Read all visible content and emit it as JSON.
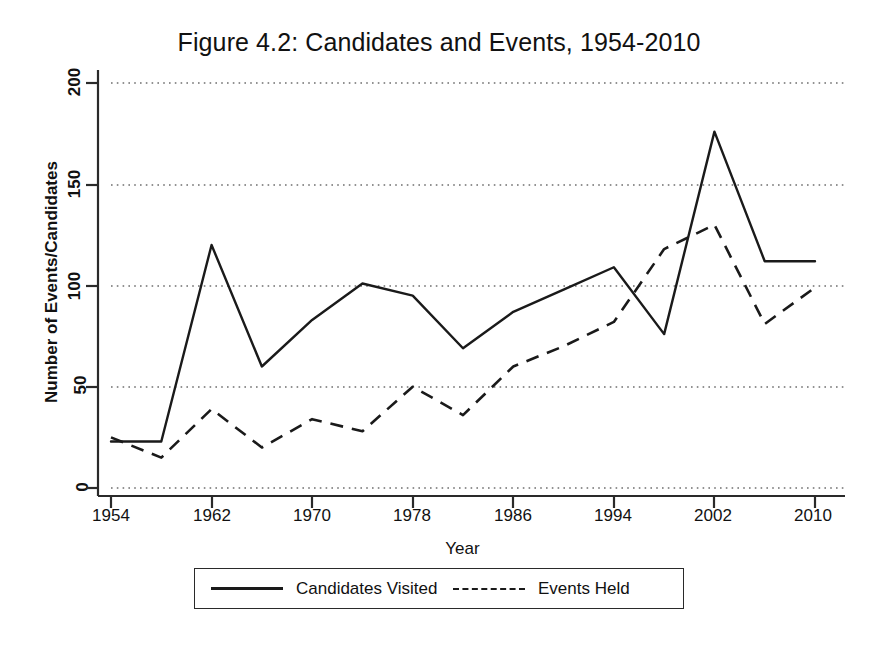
{
  "chart_data": {
    "type": "line",
    "title": "Figure 4.2: Candidates and Events, 1954-2010",
    "xlabel": "Year",
    "ylabel": "Number of Events/Candidates",
    "x": [
      1954,
      1958,
      1962,
      1966,
      1970,
      1974,
      1978,
      1982,
      1986,
      1990,
      1994,
      1998,
      2002,
      2006,
      2010
    ],
    "series": [
      {
        "name": "Candidates Visited",
        "style": "solid",
        "color": "#1a1a1a",
        "values": [
          23,
          23,
          120,
          60,
          83,
          101,
          95,
          69,
          87,
          98,
          109,
          76,
          176,
          112,
          112
        ]
      },
      {
        "name": "Events Held",
        "style": "dashed",
        "color": "#1a1a1a",
        "values": [
          25,
          15,
          39,
          20,
          34,
          28,
          50,
          36,
          60,
          70,
          82,
          118,
          130,
          81,
          99
        ]
      }
    ],
    "xlim": [
      1954,
      2010
    ],
    "ylim": [
      0,
      200
    ],
    "xticks": [
      1954,
      1962,
      1970,
      1978,
      1986,
      1994,
      2002,
      2010
    ],
    "xtick_labels": [
      "1954",
      "1962",
      "1970",
      "1978",
      "1986",
      "1994",
      "2002",
      "2010"
    ],
    "yticks": [
      0,
      50,
      100,
      150,
      200
    ],
    "ytick_labels": [
      "0",
      "50",
      "100",
      "150",
      "200"
    ],
    "grid": "horizontal-dotted",
    "legend_position": "below-axes"
  },
  "legend": {
    "entries": [
      {
        "label": "Candidates Visited",
        "key": "solid-line-key"
      },
      {
        "label": "Events Held",
        "key": "dashed-line-key"
      }
    ]
  }
}
